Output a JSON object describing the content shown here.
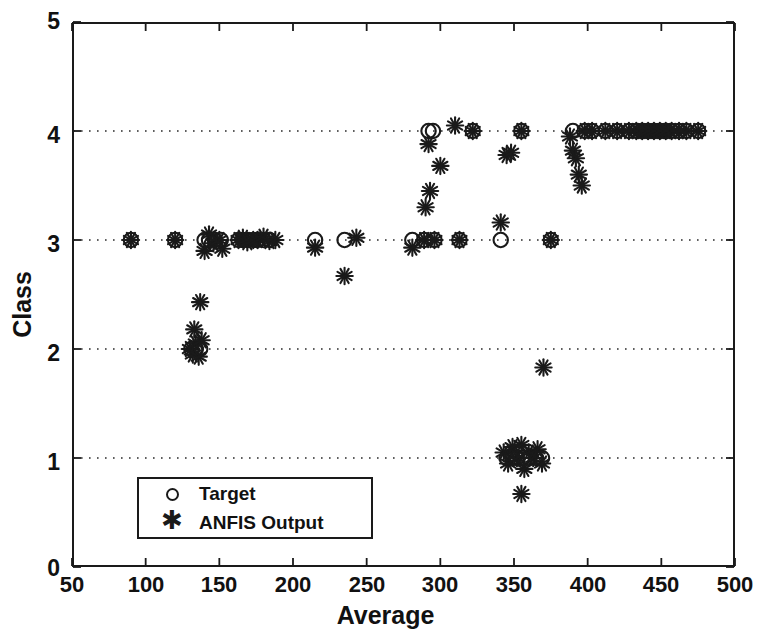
{
  "chart_data": {
    "type": "scatter",
    "title": "",
    "xlabel": "Average",
    "ylabel": "Class",
    "xlim": [
      50,
      500
    ],
    "ylim": [
      0,
      5
    ],
    "xticks": [
      50,
      100,
      150,
      200,
      250,
      300,
      350,
      400,
      450,
      500
    ],
    "yticks": [
      0,
      1,
      2,
      3,
      4,
      5
    ],
    "grid": "horizontal-dotted",
    "gridlines_y": [
      1,
      2,
      3,
      4
    ],
    "legend_position": "lower-left-inside",
    "series": [
      {
        "name": "Target",
        "marker": "circle",
        "color": "#1a1a1a",
        "points": [
          [
            90,
            3
          ],
          [
            120,
            3
          ],
          [
            131,
            2
          ],
          [
            134,
            2
          ],
          [
            137,
            2
          ],
          [
            140,
            3
          ],
          [
            143,
            3
          ],
          [
            147,
            3
          ],
          [
            151,
            3
          ],
          [
            163,
            3
          ],
          [
            166,
            3
          ],
          [
            169,
            3
          ],
          [
            173,
            3
          ],
          [
            176,
            3
          ],
          [
            180,
            3
          ],
          [
            184,
            3
          ],
          [
            215,
            3
          ],
          [
            235,
            3
          ],
          [
            281,
            3
          ],
          [
            289,
            3
          ],
          [
            296,
            3
          ],
          [
            313,
            3
          ],
          [
            322,
            4
          ],
          [
            341,
            3
          ],
          [
            345,
            1
          ],
          [
            349,
            1
          ],
          [
            352,
            1
          ],
          [
            356,
            1
          ],
          [
            360,
            1
          ],
          [
            365,
            1
          ],
          [
            369,
            1
          ],
          [
            355,
            4
          ],
          [
            375,
            3
          ],
          [
            390,
            4
          ],
          [
            398,
            4
          ],
          [
            403,
            4
          ],
          [
            412,
            4
          ],
          [
            420,
            4
          ],
          [
            428,
            4
          ],
          [
            433,
            4
          ],
          [
            437,
            4
          ],
          [
            441,
            4
          ],
          [
            445,
            4
          ],
          [
            449,
            4
          ],
          [
            453,
            4
          ],
          [
            457,
            4
          ],
          [
            462,
            4
          ],
          [
            467,
            4
          ],
          [
            292,
            4
          ],
          [
            295,
            4
          ],
          [
            475,
            4
          ]
        ]
      },
      {
        "name": "ANFIS Output",
        "marker": "asterisk",
        "color": "#1a1a1a",
        "points": [
          [
            90,
            3.0
          ],
          [
            120,
            3.0
          ],
          [
            130,
            2.0
          ],
          [
            132,
            1.95
          ],
          [
            134,
            2.05
          ],
          [
            136,
            1.93
          ],
          [
            138,
            2.08
          ],
          [
            133,
            2.18
          ],
          [
            137,
            2.43
          ],
          [
            140,
            2.9
          ],
          [
            143,
            3.05
          ],
          [
            146,
            2.97
          ],
          [
            150,
            3.0
          ],
          [
            152,
            2.92
          ],
          [
            163,
            3.0
          ],
          [
            166,
            3.02
          ],
          [
            169,
            2.98
          ],
          [
            173,
            3.0
          ],
          [
            176,
            3.0
          ],
          [
            180,
            3.03
          ],
          [
            184,
            2.99
          ],
          [
            188,
            3.0
          ],
          [
            215,
            2.93
          ],
          [
            235,
            2.67
          ],
          [
            243,
            3.02
          ],
          [
            281,
            2.93
          ],
          [
            289,
            3.0
          ],
          [
            296,
            3.0
          ],
          [
            290,
            3.3
          ],
          [
            293,
            3.45
          ],
          [
            300,
            3.68
          ],
          [
            310,
            4.05
          ],
          [
            313,
            3.0
          ],
          [
            322,
            4.0
          ],
          [
            341,
            3.16
          ],
          [
            343,
            1.05
          ],
          [
            346,
            0.95
          ],
          [
            349,
            1.1
          ],
          [
            352,
            1.0
          ],
          [
            355,
            1.12
          ],
          [
            357,
            0.9
          ],
          [
            360,
            1.05
          ],
          [
            363,
            1.0
          ],
          [
            366,
            1.08
          ],
          [
            369,
            0.95
          ],
          [
            355,
            0.67
          ],
          [
            370,
            1.83
          ],
          [
            355,
            4.0
          ],
          [
            375,
            3.0
          ],
          [
            388,
            3.95
          ],
          [
            390,
            3.82
          ],
          [
            392,
            3.75
          ],
          [
            394,
            3.6
          ],
          [
            396,
            3.5
          ],
          [
            398,
            4.0
          ],
          [
            403,
            4.0
          ],
          [
            412,
            4.0
          ],
          [
            420,
            4.0
          ],
          [
            428,
            4.0
          ],
          [
            433,
            4.0
          ],
          [
            437,
            4.0
          ],
          [
            441,
            4.0
          ],
          [
            445,
            4.0
          ],
          [
            449,
            4.0
          ],
          [
            453,
            4.0
          ],
          [
            457,
            4.0
          ],
          [
            462,
            4.0
          ],
          [
            467,
            4.0
          ],
          [
            475,
            4.0
          ],
          [
            292,
            3.88
          ],
          [
            345,
            3.78
          ],
          [
            348,
            3.8
          ]
        ]
      }
    ]
  },
  "axes": {
    "xlabel": "Average",
    "ylabel": "Class",
    "xticklabels": [
      "50",
      "100",
      "150",
      "200",
      "250",
      "300",
      "350",
      "400",
      "450",
      "500"
    ],
    "yticklabels": [
      "0",
      "1",
      "2",
      "3",
      "4",
      "5"
    ]
  },
  "legend": {
    "entries": [
      {
        "label": "Target",
        "marker": "circle-icon"
      },
      {
        "label": "ANFIS Output",
        "marker": "asterisk-icon"
      }
    ]
  }
}
